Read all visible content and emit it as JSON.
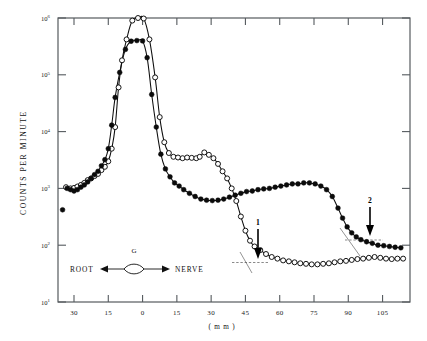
{
  "figure": {
    "background": "#ffffff",
    "ink_color": "#0d0d0d",
    "axis_color": "#555a5e"
  },
  "axes": {
    "y_title": "COUNTS PER MINUTE",
    "x_units": "( m m )",
    "y_ticklabels": [
      {
        "mantissa": "10",
        "exponent": "6",
        "value": 1000000
      },
      {
        "mantissa": "10",
        "exponent": "5",
        "value": 100000
      },
      {
        "mantissa": "10",
        "exponent": "4",
        "value": 10000
      },
      {
        "mantissa": "10",
        "exponent": "3",
        "value": 1000
      },
      {
        "mantissa": "10",
        "exponent": "2",
        "value": 100
      },
      {
        "mantissa": "10",
        "exponent": "1",
        "value": 10
      }
    ],
    "x_ticklabels": [
      "30",
      "15",
      "0",
      "15",
      "30",
      "45",
      "60",
      "75",
      "90",
      "105"
    ],
    "x_tickvalues": [
      -30,
      -15,
      0,
      15,
      30,
      45,
      60,
      75,
      90,
      105
    ],
    "xlim": [
      -37,
      117
    ],
    "ylim_log": [
      1,
      6
    ]
  },
  "annotations": {
    "root_label": "ROOT",
    "nerve_label": "NERVE",
    "ganglion_label": "G",
    "arrow_1_label": "1",
    "arrow_1_x": 48,
    "arrow_2_label": "2",
    "arrow_2_x": 97
  },
  "chart_data": {
    "type": "scatter",
    "title": "",
    "xlabel": "( m m )",
    "ylabel": "COUNTS PER MINUTE",
    "x_scale": "linear",
    "y_scale": "log",
    "xlim": [
      -37,
      117
    ],
    "ylim": [
      10,
      1000000
    ],
    "grid": false,
    "legend": null,
    "annotations": [
      {
        "text": "ROOT",
        "x": -27,
        "y": 42
      },
      {
        "text": "NERVE",
        "x": 4,
        "y": 42
      },
      {
        "text": "G",
        "x": -11,
        "y": 80
      },
      {
        "text": "1",
        "x": 48,
        "y": 260,
        "marker": "down-arrow"
      },
      {
        "text": "2",
        "x": 97,
        "y": 330,
        "marker": "down-arrow"
      }
    ],
    "series": [
      {
        "name": "open-circles",
        "marker": "open circle",
        "points": [
          [
            -33.5,
            1050
          ],
          [
            -31.5,
            1000
          ],
          [
            -30.0,
            1020
          ],
          [
            -28.5,
            1080
          ],
          [
            -27.0,
            1150
          ],
          [
            -25.5,
            1250
          ],
          [
            -24.0,
            1400
          ],
          [
            -22.5,
            1500
          ],
          [
            -21.0,
            1650
          ],
          [
            -19.5,
            1800
          ],
          [
            -18.0,
            2100
          ],
          [
            -16.5,
            2400
          ],
          [
            -15.0,
            3000
          ],
          [
            -13.5,
            5000
          ],
          [
            -12.0,
            12000
          ],
          [
            -10.5,
            60000
          ],
          [
            -9.0,
            180000
          ],
          [
            -7.0,
            420000
          ],
          [
            -4.5,
            900000
          ],
          [
            -2.0,
            1000000
          ],
          [
            0.5,
            980000
          ],
          [
            3.0,
            420000
          ],
          [
            5.5,
            90000
          ],
          [
            7.5,
            18000
          ],
          [
            9.5,
            6500
          ],
          [
            11.5,
            4200
          ],
          [
            13.5,
            3600
          ],
          [
            15.5,
            3500
          ],
          [
            17.5,
            3400
          ],
          [
            19.5,
            3500
          ],
          [
            21.5,
            3450
          ],
          [
            23.5,
            3400
          ],
          [
            25.0,
            3600
          ],
          [
            27.0,
            4300
          ],
          [
            29.0,
            3900
          ],
          [
            31.0,
            3400
          ],
          [
            33.0,
            2700
          ],
          [
            35.0,
            2000
          ],
          [
            37.0,
            1500
          ],
          [
            39.0,
            1000
          ],
          [
            41.0,
            600
          ],
          [
            43.0,
            320
          ],
          [
            45.0,
            180
          ],
          [
            47.0,
            120
          ],
          [
            49.0,
            95
          ],
          [
            51.5,
            82
          ],
          [
            54.0,
            70
          ],
          [
            56.5,
            62
          ],
          [
            59.0,
            58
          ],
          [
            61.5,
            54
          ],
          [
            64.0,
            52
          ],
          [
            66.5,
            50
          ],
          [
            69.0,
            48
          ],
          [
            71.5,
            47
          ],
          [
            74.0,
            46
          ],
          [
            76.5,
            46
          ],
          [
            79.0,
            47
          ],
          [
            81.5,
            48
          ],
          [
            84.0,
            50
          ],
          [
            86.5,
            52
          ],
          [
            89.0,
            53
          ],
          [
            91.5,
            55
          ],
          [
            94.0,
            57
          ],
          [
            96.5,
            58
          ],
          [
            99.0,
            60
          ],
          [
            101.5,
            62
          ],
          [
            104.0,
            60
          ],
          [
            106.5,
            58
          ],
          [
            109.0,
            57
          ],
          [
            111.5,
            58
          ],
          [
            114.0,
            58
          ]
        ]
      },
      {
        "name": "filled-circles",
        "marker": "filled circle",
        "points": [
          [
            -35.0,
            420
          ],
          [
            -33.0,
            1000
          ],
          [
            -31.5,
            950
          ],
          [
            -30.0,
            900
          ],
          [
            -28.5,
            950
          ],
          [
            -27.0,
            1050
          ],
          [
            -25.5,
            1150
          ],
          [
            -24.0,
            1300
          ],
          [
            -22.5,
            1500
          ],
          [
            -21.0,
            1750
          ],
          [
            -19.5,
            2000
          ],
          [
            -18.0,
            2500
          ],
          [
            -16.5,
            3200
          ],
          [
            -15.0,
            5000
          ],
          [
            -13.5,
            13000
          ],
          [
            -12.0,
            40000
          ],
          [
            -10.0,
            110000
          ],
          [
            -7.5,
            280000
          ],
          [
            -5.0,
            390000
          ],
          [
            -2.5,
            400000
          ],
          [
            0.0,
            395000
          ],
          [
            2.0,
            200000
          ],
          [
            4.0,
            45000
          ],
          [
            6.0,
            12000
          ],
          [
            8.0,
            4000
          ],
          [
            10.0,
            2200
          ],
          [
            12.0,
            1600
          ],
          [
            14.0,
            1250
          ],
          [
            16.0,
            1100
          ],
          [
            18.0,
            950
          ],
          [
            20.5,
            820
          ],
          [
            23.0,
            720
          ],
          [
            25.5,
            650
          ],
          [
            28.0,
            620
          ],
          [
            30.5,
            610
          ],
          [
            33.0,
            620
          ],
          [
            35.5,
            650
          ],
          [
            38.0,
            700
          ],
          [
            40.5,
            760
          ],
          [
            43.0,
            820
          ],
          [
            45.5,
            880
          ],
          [
            48.0,
            900
          ],
          [
            50.5,
            950
          ],
          [
            53.0,
            980
          ],
          [
            55.5,
            1000
          ],
          [
            58.0,
            1050
          ],
          [
            60.5,
            1100
          ],
          [
            63.0,
            1150
          ],
          [
            65.5,
            1200
          ],
          [
            68.0,
            1200
          ],
          [
            70.5,
            1250
          ],
          [
            73.0,
            1250
          ],
          [
            75.5,
            1200
          ],
          [
            78.0,
            1100
          ],
          [
            80.5,
            950
          ],
          [
            83.0,
            720
          ],
          [
            85.5,
            450
          ],
          [
            87.5,
            300
          ],
          [
            89.5,
            210
          ],
          [
            91.5,
            165
          ],
          [
            93.5,
            140
          ],
          [
            95.5,
            125
          ],
          [
            98.0,
            115
          ],
          [
            100.5,
            108
          ],
          [
            103.0,
            100
          ],
          [
            105.5,
            98
          ],
          [
            108.0,
            95
          ],
          [
            110.5,
            92
          ],
          [
            113.0,
            90
          ]
        ]
      }
    ]
  }
}
